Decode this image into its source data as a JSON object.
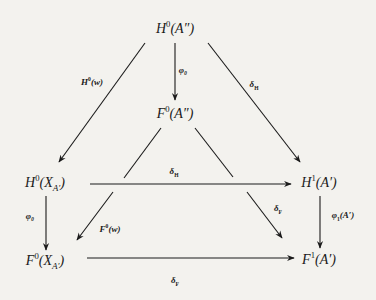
{
  "diagram": {
    "nodes": {
      "top": {
        "base": "H",
        "sup": "0",
        "arg": "(A″)"
      },
      "mid": {
        "base": "F",
        "sup": "0",
        "arg": "(A″)"
      },
      "left_upper": {
        "base": "H",
        "sup": "0",
        "arg_open": "(X",
        "sub": "A′",
        "arg_close": ")"
      },
      "right_upper": {
        "base": "H",
        "sup": "1",
        "arg": "(A′)"
      },
      "left_lower": {
        "base": "F",
        "sup": "0",
        "arg_open": "(X",
        "sub": "A′",
        "arg_close": ")"
      },
      "right_lower": {
        "base": "F",
        "sup": "1",
        "arg": "(A′)"
      }
    },
    "arrows": {
      "top_to_mid": {
        "label": "φ₀"
      },
      "top_to_left_upper": {
        "label_base": "H",
        "label_sup": "0",
        "label_arg": "(w)"
      },
      "top_to_right_upper": {
        "label_base": "δ",
        "label_sub": "H"
      },
      "left_upper_to_right_upper": {
        "label_base": "δ",
        "label_sub": "H"
      },
      "left_upper_to_left_lower": {
        "label": "φ₀"
      },
      "right_upper_to_right_lower": {
        "label_base": "φ",
        "label_sub": "1",
        "label_arg": "(A′)"
      },
      "mid_to_left_lower": {
        "label_base": "F",
        "label_sup": "0",
        "label_arg": "(w)"
      },
      "mid_to_right_lower": {
        "label_base": "δ",
        "label_sub": "F"
      },
      "left_lower_to_right_lower": {
        "label_base": "δ",
        "label_sub": "F"
      }
    },
    "colors": {
      "background": "#f3f2ee",
      "ink": "#1a1a1a"
    }
  }
}
